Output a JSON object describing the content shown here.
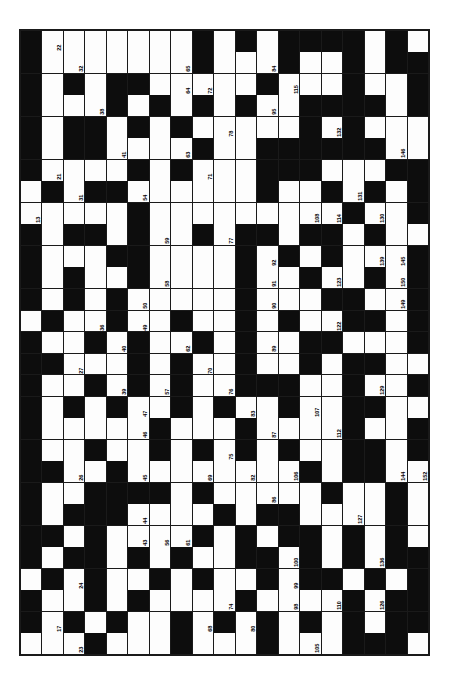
{
  "document": {
    "type": "crossword-puzzle-grid",
    "orientation": "rotated-90",
    "background_color": "#ffffff",
    "block_color": "#0d0d0d",
    "cell_color": "#fdfdfd",
    "line_color": "#1a1a1a"
  },
  "grid": {
    "columns": 19,
    "rows": 29,
    "max_clue_number": 153,
    "legend": {
      "block": "#",
      "open": ".",
      "note": "Rows are listed top-to-bottom as printed; '#' marks a shaded (block) square."
    },
    "pattern": [
      "#.......#.#.####.#.",
      "#.......#...#..#.##",
      "#.#.##.....#...#..#",
      "#...#.#.#.#..####.#",
      "#.##.#.#.....#.#...",
      "#.##....#..######..",
      "#....#.#...###...##",
      ".#.##......#..#.#.#",
      ".....#.........#..#",
      "#.##.#..#.##.##.#..",
      "#...##....#.#.#...#",
      "#.#..#....#..#..#.#",
      "#.#.#.....#...##..#",
      ".#..#..#..#.#..##.#",
      "#..#.#..#.#..##...#",
      "##...#.#..#..#.##..",
      "#..#.#.#..###..#..#",
      "#.#.#..#.#..#..##..",
      "#.....#...#....#..#",
      "#..#..#.#.#.#..##.#",
      "##..#........#.##..",
      "#..####.#.....#..#.",
      "#.###....#.##....#.",
      "##.#....#.#.##.#.#.",
      "#.##.#.#..##.#.#.##",
      ".#.#..#.#..#.##.#.#",
      "#..#.#....#....#.##",
      "#.#.#..#.#.#.#.#.##",
      "...#...#...#...###."
    ],
    "numbers": [
      {
        "row": 1,
        "col": 2,
        "n": 22
      },
      {
        "row": 1,
        "col": 13,
        "n": 117
      },
      {
        "row": 2,
        "col": 1,
        "n": 15
      },
      {
        "row": 2,
        "col": 3,
        "n": 32
      },
      {
        "row": 2,
        "col": 8,
        "n": 65
      },
      {
        "row": 2,
        "col": 12,
        "n": 84
      },
      {
        "row": 2,
        "col": 13,
        "n": 116
      },
      {
        "row": 3,
        "col": 8,
        "n": 64
      },
      {
        "row": 3,
        "col": 9,
        "n": 72
      },
      {
        "row": 3,
        "col": 12,
        "n": 96
      },
      {
        "row": 3,
        "col": 13,
        "n": 115
      },
      {
        "row": 3,
        "col": 16,
        "n": 142
      },
      {
        "row": 4,
        "col": 1,
        "n": 14
      },
      {
        "row": 4,
        "col": 4,
        "n": 38
      },
      {
        "row": 4,
        "col": 12,
        "n": 95
      },
      {
        "row": 4,
        "col": 14,
        "n": 125
      },
      {
        "row": 5,
        "col": 10,
        "n": 78
      },
      {
        "row": 5,
        "col": 14,
        "n": 124
      },
      {
        "row": 5,
        "col": 15,
        "n": 132
      },
      {
        "row": 6,
        "col": 5,
        "n": 41
      },
      {
        "row": 6,
        "col": 8,
        "n": 63
      },
      {
        "row": 6,
        "col": 12,
        "n": 94
      },
      {
        "row": 6,
        "col": 13,
        "n": 104
      },
      {
        "row": 6,
        "col": 17,
        "n": 141
      },
      {
        "row": 6,
        "col": 18,
        "n": 146
      },
      {
        "row": 7,
        "col": 2,
        "n": 21
      },
      {
        "row": 7,
        "col": 9,
        "n": 71
      },
      {
        "row": 7,
        "col": 14,
        "n": 109
      },
      {
        "row": 8,
        "col": 3,
        "n": 31
      },
      {
        "row": 8,
        "col": 6,
        "n": 54
      },
      {
        "row": 8,
        "col": 12,
        "n": 93
      },
      {
        "row": 8,
        "col": 16,
        "n": 131
      },
      {
        "row": 9,
        "col": 1,
        "n": 13
      },
      {
        "row": 9,
        "col": 6,
        "n": 53
      },
      {
        "row": 9,
        "col": 14,
        "n": 108
      },
      {
        "row": 9,
        "col": 15,
        "n": 114
      },
      {
        "row": 9,
        "col": 17,
        "n": 130
      },
      {
        "row": 10,
        "col": 3,
        "n": 30
      },
      {
        "row": 10,
        "col": 4,
        "n": 37
      },
      {
        "row": 10,
        "col": 6,
        "n": 52
      },
      {
        "row": 10,
        "col": 7,
        "n": 59
      },
      {
        "row": 10,
        "col": 10,
        "n": 77
      },
      {
        "row": 10,
        "col": 17,
        "n": 140
      },
      {
        "row": 11,
        "col": 1,
        "n": 12
      },
      {
        "row": 11,
        "col": 6,
        "n": 51
      },
      {
        "row": 11,
        "col": 12,
        "n": 92
      },
      {
        "row": 11,
        "col": 17,
        "n": 139
      },
      {
        "row": 11,
        "col": 18,
        "n": 145
      },
      {
        "row": 12,
        "col": 3,
        "n": 29
      },
      {
        "row": 12,
        "col": 7,
        "n": 58
      },
      {
        "row": 12,
        "col": 12,
        "n": 91
      },
      {
        "row": 12,
        "col": 15,
        "n": 123
      },
      {
        "row": 12,
        "col": 18,
        "n": 150
      },
      {
        "row": 12,
        "col": 19,
        "n": 153
      },
      {
        "row": 13,
        "col": 1,
        "n": 11
      },
      {
        "row": 13,
        "col": 3,
        "n": 28
      },
      {
        "row": 13,
        "col": 6,
        "n": 50
      },
      {
        "row": 13,
        "col": 12,
        "n": 90
      },
      {
        "row": 13,
        "col": 18,
        "n": 149
      },
      {
        "row": 14,
        "col": 4,
        "n": 36
      },
      {
        "row": 14,
        "col": 6,
        "n": 49
      },
      {
        "row": 14,
        "col": 15,
        "n": 122
      },
      {
        "row": 15,
        "col": 1,
        "n": 10
      },
      {
        "row": 15,
        "col": 5,
        "n": 40
      },
      {
        "row": 15,
        "col": 6,
        "n": 48
      },
      {
        "row": 15,
        "col": 8,
        "n": 62
      },
      {
        "row": 15,
        "col": 12,
        "n": 89
      },
      {
        "row": 15,
        "col": 14,
        "n": 113
      },
      {
        "row": 16,
        "col": 2,
        "n": 20
      },
      {
        "row": 16,
        "col": 3,
        "n": 27
      },
      {
        "row": 16,
        "col": 9,
        "n": 70
      },
      {
        "row": 16,
        "col": 16,
        "n": 121
      },
      {
        "row": 17,
        "col": 4,
        "n": 35
      },
      {
        "row": 17,
        "col": 5,
        "n": 39
      },
      {
        "row": 17,
        "col": 7,
        "n": 57
      },
      {
        "row": 17,
        "col": 10,
        "n": 76
      },
      {
        "row": 17,
        "col": 12,
        "n": 88
      },
      {
        "row": 17,
        "col": 16,
        "n": 120
      },
      {
        "row": 17,
        "col": 17,
        "n": 129
      },
      {
        "row": 18,
        "col": 1,
        "n": 9
      },
      {
        "row": 18,
        "col": 6,
        "n": 47
      },
      {
        "row": 18,
        "col": 11,
        "n": 83
      },
      {
        "row": 18,
        "col": 13,
        "n": 103
      },
      {
        "row": 18,
        "col": 14,
        "n": 107
      },
      {
        "row": 18,
        "col": 17,
        "n": 138
      },
      {
        "row": 19,
        "col": 1,
        "n": 8
      },
      {
        "row": 19,
        "col": 6,
        "n": 46
      },
      {
        "row": 19,
        "col": 12,
        "n": 87
      },
      {
        "row": 19,
        "col": 15,
        "n": 112
      },
      {
        "row": 20,
        "col": 1,
        "n": 7
      },
      {
        "row": 20,
        "col": 10,
        "n": 75
      },
      {
        "row": 20,
        "col": 13,
        "n": 102
      },
      {
        "row": 20,
        "col": 16,
        "n": 128
      },
      {
        "row": 21,
        "col": 2,
        "n": 19
      },
      {
        "row": 21,
        "col": 3,
        "n": 26
      },
      {
        "row": 21,
        "col": 6,
        "n": 45
      },
      {
        "row": 21,
        "col": 9,
        "n": 69
      },
      {
        "row": 21,
        "col": 11,
        "n": 82
      },
      {
        "row": 21,
        "col": 13,
        "n": 106
      },
      {
        "row": 21,
        "col": 14,
        "n": 111
      },
      {
        "row": 21,
        "col": 17,
        "n": 137
      },
      {
        "row": 21,
        "col": 18,
        "n": 144
      },
      {
        "row": 21,
        "col": 19,
        "n": 152
      },
      {
        "row": 22,
        "col": 4,
        "n": 34
      },
      {
        "row": 22,
        "col": 12,
        "n": 86
      },
      {
        "row": 22,
        "col": 15,
        "n": 119
      },
      {
        "row": 23,
        "col": 1,
        "n": 6
      },
      {
        "row": 23,
        "col": 6,
        "n": 44
      },
      {
        "row": 23,
        "col": 13,
        "n": 101
      },
      {
        "row": 23,
        "col": 16,
        "n": 127
      },
      {
        "row": 23,
        "col": 18,
        "n": 148
      },
      {
        "row": 24,
        "col": 1,
        "n": 5
      },
      {
        "row": 24,
        "col": 2,
        "n": 18
      },
      {
        "row": 24,
        "col": 6,
        "n": 43
      },
      {
        "row": 24,
        "col": 7,
        "n": 56
      },
      {
        "row": 24,
        "col": 8,
        "n": 61
      },
      {
        "row": 25,
        "col": 3,
        "n": 25
      },
      {
        "row": 25,
        "col": 11,
        "n": 81
      },
      {
        "row": 25,
        "col": 13,
        "n": 100
      },
      {
        "row": 25,
        "col": 17,
        "n": 136
      },
      {
        "row": 26,
        "col": 3,
        "n": 24
      },
      {
        "row": 26,
        "col": 9,
        "n": 60
      },
      {
        "row": 26,
        "col": 13,
        "n": 99
      },
      {
        "row": 26,
        "col": 17,
        "n": 135
      },
      {
        "row": 27,
        "col": 1,
        "n": 4
      },
      {
        "row": 27,
        "col": 6,
        "n": 42
      },
      {
        "row": 27,
        "col": 10,
        "n": 74
      },
      {
        "row": 27,
        "col": 13,
        "n": 98
      },
      {
        "row": 27,
        "col": 15,
        "n": 110
      },
      {
        "row": 27,
        "col": 17,
        "n": 126
      },
      {
        "row": 28,
        "col": 1,
        "n": 3
      },
      {
        "row": 28,
        "col": 2,
        "n": 17
      },
      {
        "row": 28,
        "col": 9,
        "n": 68
      },
      {
        "row": 28,
        "col": 11,
        "n": 80
      },
      {
        "row": 29,
        "col": 3,
        "n": 23
      },
      {
        "row": 29,
        "col": 12,
        "n": 85
      },
      {
        "row": 29,
        "col": 14,
        "n": 105
      },
      {
        "row": 30,
        "col": 1,
        "n": 2
      },
      {
        "row": 30,
        "col": 9,
        "n": 67
      },
      {
        "row": 30,
        "col": 17,
        "n": 134
      },
      {
        "row": 30,
        "col": 19,
        "n": 151
      },
      {
        "row": 31,
        "col": 1,
        "n": 1
      },
      {
        "row": 31,
        "col": 2,
        "n": 16
      },
      {
        "row": 31,
        "col": 4,
        "n": 33
      },
      {
        "row": 31,
        "col": 7,
        "n": 55
      },
      {
        "row": 31,
        "col": 9,
        "n": 66
      },
      {
        "row": 31,
        "col": 10,
        "n": 73
      },
      {
        "row": 31,
        "col": 11,
        "n": 79
      },
      {
        "row": 31,
        "col": 13,
        "n": 97
      },
      {
        "row": 31,
        "col": 15,
        "n": 118
      },
      {
        "row": 31,
        "col": 17,
        "n": 133
      },
      {
        "row": 31,
        "col": 18,
        "n": 143
      },
      {
        "row": 31,
        "col": 19,
        "n": 147
      }
    ]
  }
}
